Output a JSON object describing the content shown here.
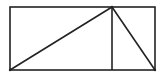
{
  "diagram": {
    "width": 168,
    "height": 78,
    "stroke_color": "#222222",
    "background": "#ffffff",
    "rectangle": {
      "x": 10,
      "y": 7,
      "width": 145,
      "height": 63
    },
    "lines": [
      {
        "name": "vertical-divider",
        "x1": 112,
        "y1": 7,
        "x2": 112,
        "y2": 70
      },
      {
        "name": "left-diagonal",
        "x1": 10,
        "y1": 70,
        "x2": 112,
        "y2": 7
      },
      {
        "name": "right-diagonal",
        "x1": 112,
        "y1": 7,
        "x2": 155,
        "y2": 70
      }
    ],
    "points": [
      {
        "name": "apex-point",
        "x": 112,
        "y": 7
      },
      {
        "name": "bottom-left-point",
        "x": 10,
        "y": 70
      },
      {
        "name": "bottom-right-point",
        "x": 155,
        "y": 70
      }
    ]
  }
}
